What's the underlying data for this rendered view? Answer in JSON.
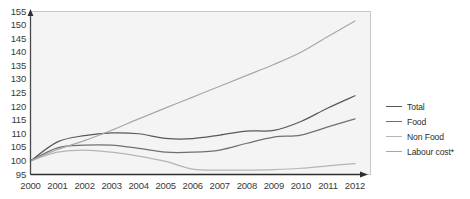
{
  "chart_data": {
    "type": "line",
    "title": "",
    "subtitle": "",
    "xlabel": "",
    "ylabel": "",
    "categories": [
      "2000",
      "2001",
      "2002",
      "2003",
      "2004",
      "2005",
      "2006",
      "2007",
      "2008",
      "2009",
      "2010",
      "2011",
      "2012"
    ],
    "x": [
      2000,
      2001,
      2002,
      2003,
      2004,
      2005,
      2006,
      2007,
      2008,
      2009,
      2010,
      2011,
      2012
    ],
    "ylim": [
      95,
      155
    ],
    "yticks": [
      95,
      100,
      105,
      110,
      115,
      120,
      125,
      130,
      135,
      140,
      145,
      150,
      155
    ],
    "grid": false,
    "legend_position": "right",
    "series": [
      {
        "name": "Total",
        "color": "#595959",
        "values": [
          100.0,
          107.0,
          109.3,
          110.3,
          110.0,
          108.3,
          108.2,
          109.5,
          111.0,
          111.2,
          114.5,
          119.5,
          124.0
        ]
      },
      {
        "name": "Food",
        "color": "#707070",
        "values": [
          100.0,
          104.8,
          105.8,
          105.8,
          104.6,
          103.2,
          103.2,
          104.0,
          106.5,
          108.8,
          109.5,
          112.5,
          115.5
        ]
      },
      {
        "name": "Non Food",
        "color": "#b5b5b5",
        "values": [
          100.0,
          103.2,
          104.0,
          103.2,
          101.8,
          99.8,
          97.0,
          96.6,
          96.6,
          96.8,
          97.3,
          98.2,
          99.0
        ]
      },
      {
        "name": "Labour cost*",
        "color": "#a8a8a8",
        "values": [
          100.0,
          104.2,
          107.5,
          111.3,
          115.5,
          119.5,
          123.5,
          127.5,
          131.5,
          135.5,
          140.0,
          145.8,
          151.5
        ]
      }
    ]
  },
  "legend": {
    "items": [
      {
        "label": "Total",
        "color": "#595959"
      },
      {
        "label": "Food",
        "color": "#707070"
      },
      {
        "label": "Non Food",
        "color": "#b5b5b5"
      },
      {
        "label": "Labour cost*",
        "color": "#a8a8a8"
      }
    ]
  },
  "axes": {
    "y_tick_labels": [
      "155",
      "150",
      "145",
      "140",
      "135",
      "130",
      "125",
      "120",
      "115",
      "110",
      "105",
      "100",
      "95"
    ],
    "x_tick_labels": [
      "2000",
      "2001",
      "2002",
      "2003",
      "2004",
      "2005",
      "2006",
      "2007",
      "2008",
      "2009",
      "2010",
      "2011",
      "2012"
    ]
  },
  "style": {
    "plot_background": "#f4f4f4",
    "axis_color": "#4a4a4a",
    "text_color": "#3a3a3a"
  }
}
